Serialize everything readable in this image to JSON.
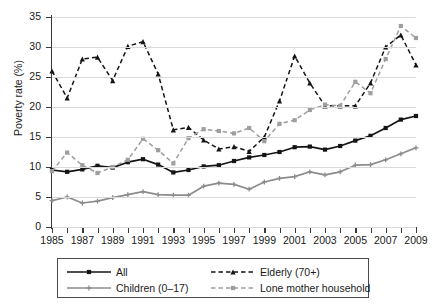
{
  "chart_data": {
    "type": "line",
    "title": "",
    "xlabel": "",
    "ylabel": "Poverty rate (%)",
    "xlim": [
      1985,
      2009
    ],
    "ylim": [
      0,
      35
    ],
    "yticks": [
      0,
      5,
      10,
      15,
      20,
      25,
      30,
      35
    ],
    "ytick_labels": [
      "0",
      "5",
      "10",
      "15",
      "20",
      "25",
      "30",
      "35"
    ],
    "xticks": [
      1985,
      1987,
      1989,
      1991,
      1993,
      1995,
      1997,
      1999,
      2001,
      2003,
      2005,
      2007,
      2009
    ],
    "xtick_labels": [
      "1985",
      "1987",
      "1989",
      "1991",
      "1993",
      "1995",
      "1997",
      "1999",
      "2001",
      "2003",
      "2005",
      "2007",
      "2009"
    ],
    "x": [
      1985,
      1986,
      1987,
      1988,
      1989,
      1990,
      1991,
      1992,
      1993,
      1994,
      1995,
      1996,
      1997,
      1998,
      1999,
      2000,
      2001,
      2002,
      2003,
      2004,
      2005,
      2006,
      2007,
      2008,
      2009
    ],
    "grid": "horizontal",
    "legend_position": "below-plot",
    "series": [
      {
        "name": "All",
        "style": "solid",
        "color": "#141414",
        "marker": "square",
        "values": [
          9.5,
          9.2,
          9.6,
          10.2,
          9.9,
          10.8,
          11.3,
          10.4,
          9.1,
          9.5,
          10.1,
          10.3,
          11.0,
          11.6,
          12.0,
          12.5,
          13.3,
          13.4,
          12.9,
          13.5,
          14.4,
          15.2,
          16.5,
          17.9,
          18.5
        ]
      },
      {
        "name": "Children (0–17)",
        "style": "solid",
        "color": "#8c8c8c",
        "marker": "plus",
        "values": [
          4.4,
          5.0,
          4.0,
          4.3,
          4.9,
          5.4,
          5.9,
          5.4,
          5.3,
          5.3,
          6.8,
          7.3,
          7.1,
          6.3,
          7.5,
          8.1,
          8.4,
          9.2,
          8.7,
          9.2,
          10.3,
          10.4,
          11.2,
          12.2,
          13.2
        ]
      },
      {
        "name": "Elderly (70+)",
        "style": "dashed",
        "color": "#141414",
        "marker": "triangle",
        "values": [
          26.0,
          21.5,
          28.0,
          28.3,
          24.4,
          30.1,
          30.9,
          25.5,
          16.2,
          16.6,
          14.5,
          13.0,
          13.4,
          12.6,
          15.0,
          21.0,
          28.5,
          24.0,
          20.2,
          20.2,
          20.2,
          24.0,
          30.0,
          32.0,
          27.0
        ]
      },
      {
        "name": "Lone mother household",
        "style": "dashed",
        "color": "#9e9e9e",
        "marker": "square",
        "values": [
          9.3,
          12.4,
          10.3,
          9.0,
          10.0,
          11.2,
          14.7,
          12.8,
          10.6,
          14.8,
          16.3,
          16.0,
          15.6,
          16.5,
          14.3,
          17.2,
          17.8,
          19.5,
          20.4,
          20.2,
          24.2,
          22.3,
          28.0,
          33.5,
          31.5
        ]
      }
    ]
  },
  "legend": {
    "entries": [
      {
        "label": "All"
      },
      {
        "label": "Elderly (70+)"
      },
      {
        "label": "Children (0–17)"
      },
      {
        "label": "Lone mother household"
      }
    ]
  }
}
